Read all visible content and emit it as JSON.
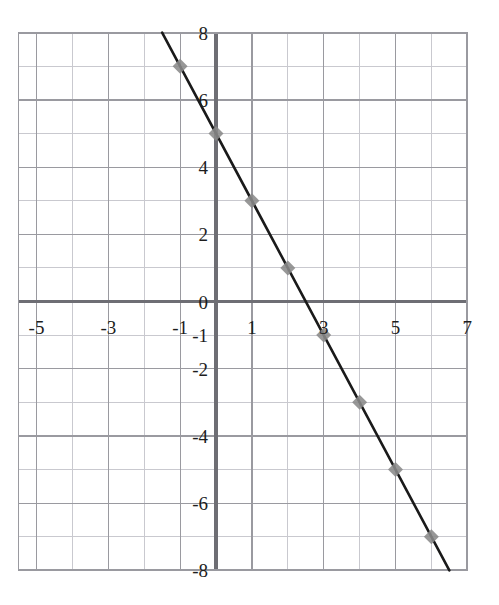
{
  "chart_data": {
    "type": "line",
    "title": "",
    "subtitle": "",
    "xlabel": "",
    "ylabel": "",
    "xlim": [
      -5.5,
      7.0
    ],
    "ylim": [
      -8.0,
      8.0
    ],
    "grid": true,
    "legend": null,
    "legend_position": "none",
    "x_ticks": [
      {
        "value": -5,
        "label": "-5"
      },
      {
        "value": -3,
        "label": "-3"
      },
      {
        "value": -1,
        "label": "-1"
      },
      {
        "value": 1,
        "label": "1"
      },
      {
        "value": 3,
        "label": "3"
      },
      {
        "value": 5,
        "label": "5"
      },
      {
        "value": 7,
        "label": "7"
      }
    ],
    "y_ticks": [
      {
        "value": 8,
        "label": "8"
      },
      {
        "value": 6,
        "label": "6"
      },
      {
        "value": 4,
        "label": "4"
      },
      {
        "value": 2,
        "label": "2"
      },
      {
        "value": 0,
        "label": "0"
      },
      {
        "value": -1,
        "label": "-1"
      },
      {
        "value": -2,
        "label": "-2"
      },
      {
        "value": -4,
        "label": "-4"
      },
      {
        "value": -6,
        "label": "-6"
      },
      {
        "value": -8,
        "label": "-8"
      }
    ],
    "grid_step_x": 1,
    "grid_step_y": 1,
    "series": [
      {
        "name": "line",
        "equation": "y = -2x + 5",
        "slope": -2,
        "intercept": 5,
        "line_color": "#1a1a1a",
        "line_width": 2.6,
        "marker": "diamond",
        "marker_color": "#8a8a8a",
        "marker_size": 15,
        "x": [
          -1,
          0,
          1,
          2,
          3,
          4,
          5,
          6
        ],
        "values": [
          7,
          5,
          3,
          1,
          -1,
          -3,
          -5,
          -7
        ],
        "points": [
          {
            "x": -1,
            "y": 7
          },
          {
            "x": 0,
            "y": 5
          },
          {
            "x": 1,
            "y": 3
          },
          {
            "x": 2,
            "y": 1
          },
          {
            "x": 3,
            "y": -1
          },
          {
            "x": 4,
            "y": -3
          },
          {
            "x": 5,
            "y": -5
          },
          {
            "x": 6,
            "y": -7
          }
        ],
        "line_endpoints": [
          {
            "x": -1.5,
            "y": 8
          },
          {
            "x": 6.5,
            "y": -8
          }
        ]
      }
    ],
    "colors": {
      "grid": "#9a9aa0",
      "grid_minor": "#c9c9cf",
      "axis": "#6e6e74",
      "background": "#ffffff",
      "text": "#1d1d1d",
      "marker": "#8a8a8a",
      "line": "#1a1a1a"
    }
  }
}
